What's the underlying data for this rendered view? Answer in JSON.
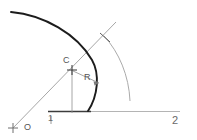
{
  "diagram": {
    "background_color": "#ffffff",
    "canvas": {
      "width": 197,
      "height": 140
    },
    "colors": {
      "main_curve": "#1a1a1a",
      "construction_line": "#8c8c8c",
      "secondary_arc": "#9a9a9a",
      "baseline_dark": "#3a3a3a",
      "baseline_light": "#b0b0b0",
      "label_text": "#555555"
    },
    "labels": [
      {
        "id": "center-label",
        "text": "C",
        "x": 63,
        "y": 56,
        "role": "arc center point label"
      },
      {
        "id": "radius-label",
        "text": "R",
        "x": 84,
        "y": 73,
        "role": "radius dimension label"
      },
      {
        "id": "origin-label",
        "text": "O",
        "x": 24,
        "y": 123,
        "role": "origin point label"
      },
      {
        "id": "station-1-label",
        "text": "1",
        "x": 48,
        "y": 114,
        "role": "baseline station tick 1"
      },
      {
        "id": "station-2-label",
        "text": "2",
        "x": 172,
        "y": 115,
        "role": "baseline station label 2"
      }
    ],
    "points": [
      {
        "id": "center-point",
        "label": "C",
        "x": 72,
        "y": 70,
        "marker": "cross"
      },
      {
        "id": "origin-point",
        "label": "O",
        "x": 13,
        "y": 128,
        "marker": "cross"
      },
      {
        "id": "arc-intersection",
        "label": "",
        "x": 105,
        "y": 37,
        "marker": "cross"
      }
    ],
    "geometry": {
      "main_arc": {
        "name": "main-curve",
        "start": [
          11,
          12
        ],
        "end": [
          88,
          111
        ],
        "stroke_width": 1.9,
        "description": "thick dark curve sweeping from upper-left down to baseline"
      },
      "secondary_arc": {
        "name": "secondary-arc",
        "start": [
          104,
          36
        ],
        "end": [
          130,
          101
        ],
        "stroke_width": 0.9,
        "description": "light gray arc to the right of main curve"
      },
      "construction_line": {
        "name": "origin-to-arc-line",
        "start": [
          13,
          128
        ],
        "end": [
          116,
          22
        ],
        "stroke_width": 0.8,
        "description": "diagonal ray from O through C to beyond the arc"
      },
      "vertical_line": {
        "name": "center-ordinate",
        "start": [
          72,
          70
        ],
        "end": [
          72,
          113
        ],
        "stroke_width": 0.8
      },
      "radius_leader": {
        "name": "radius-leader-arrow",
        "start": [
          72,
          70
        ],
        "end": [
          101,
          84
        ],
        "arrow": true
      },
      "baseline": {
        "name": "horizontal-baseline",
        "start": [
          48,
          112
        ],
        "end": [
          180,
          112
        ],
        "dark_segment_end": 90
      },
      "station_tick": {
        "name": "station-1-tick",
        "x": 51,
        "y_top": 116,
        "y_bottom": 124
      }
    }
  }
}
